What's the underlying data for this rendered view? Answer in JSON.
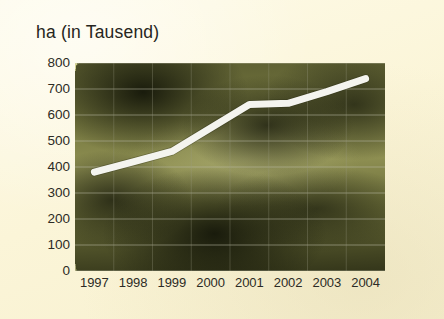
{
  "chart_data": {
    "type": "line",
    "title": "ha (in Tausend)",
    "xlabel": "",
    "ylabel": "ha (in Tausend)",
    "categories": [
      "1997",
      "1998",
      "1999",
      "2000",
      "2001",
      "2002",
      "2003",
      "2004"
    ],
    "values": [
      380,
      420,
      460,
      550,
      640,
      645,
      690,
      740
    ],
    "series": [
      {
        "name": "Anbaufläche",
        "values": [
          380,
          420,
          460,
          550,
          640,
          645,
          690,
          740
        ]
      }
    ],
    "ylim": [
      0,
      800
    ],
    "ytick_values": [
      800,
      700,
      600,
      500,
      400,
      300,
      200,
      100,
      0
    ],
    "ytick_labels": [
      "800",
      "700",
      "600",
      "500",
      "400",
      "300",
      "200",
      "100",
      "0"
    ],
    "xtick_labels": [
      "1997",
      "1998",
      "1999",
      "2000",
      "2001",
      "2002",
      "2003",
      "2004"
    ],
    "grid": true,
    "legend": false,
    "legend_position": "none",
    "line_color": "#f4f4ef",
    "background_color": "#fcf7dd",
    "plot_background": "photo-barley-field"
  }
}
